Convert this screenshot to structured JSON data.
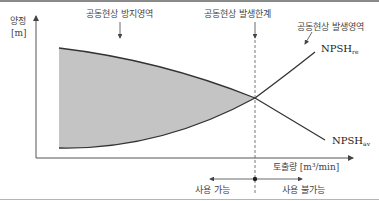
{
  "diagram": {
    "y_axis": {
      "label": "양정",
      "unit": "[m]"
    },
    "x_axis": {
      "label": "토출량 [m³/min]"
    },
    "annotations": {
      "prevention_region": "공동현상 방지영역",
      "occurrence_limit": "공동현상 발생한계",
      "occurrence_region": "공동현상 발생영역"
    },
    "curves": {
      "required": {
        "name": "NPSH",
        "sub": "re"
      },
      "available": {
        "name": "NPSH",
        "sub": "av"
      }
    },
    "usage": {
      "usable": "사용 가능",
      "unusable": "사용 불가능"
    },
    "colors": {
      "shaded_region": "#c4c4c4",
      "curve": "#333333",
      "axis": "#555555"
    }
  }
}
